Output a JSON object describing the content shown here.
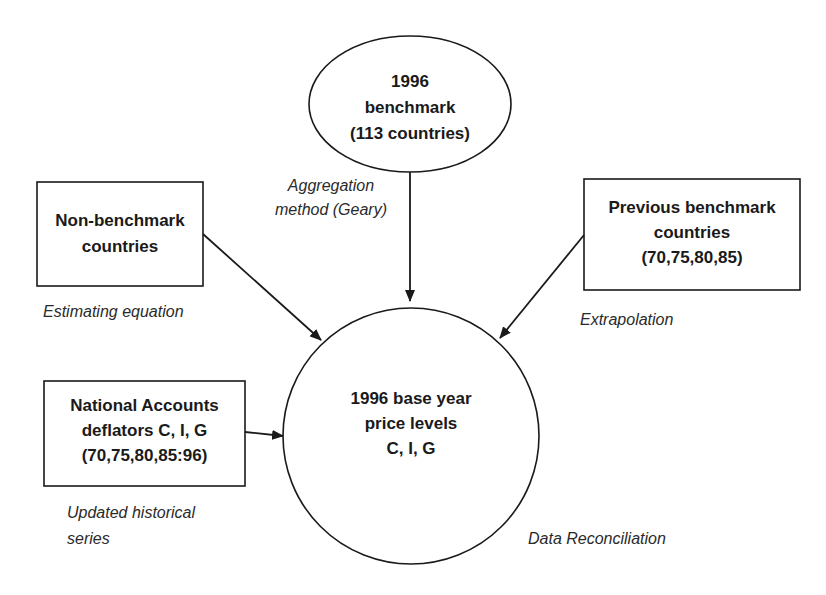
{
  "diagram": {
    "type": "flow",
    "nodes": {
      "benchmark_1996": {
        "shape": "ellipse",
        "lines": [
          "1996",
          "benchmark",
          "(113 countries)"
        ]
      },
      "non_benchmark": {
        "shape": "rectangle",
        "lines": [
          "Non-benchmark",
          "countries"
        ]
      },
      "previous_benchmark": {
        "shape": "rectangle",
        "lines": [
          "Previous benchmark",
          "countries",
          "(70,75,80,85)"
        ]
      },
      "national_accounts": {
        "shape": "rectangle",
        "lines": [
          "National Accounts",
          "deflators C, I, G",
          "(70,75,80,85:96)"
        ]
      },
      "base_year": {
        "shape": "circle",
        "lines": [
          "1996 base year",
          "price levels",
          "C, I, G"
        ]
      }
    },
    "edge_labels": {
      "aggregation": {
        "line1": "Aggregation",
        "line2_prefix": "method (",
        "line2_italic": "Geary",
        "line2_suffix": ")"
      },
      "estimating": "Estimating equation",
      "extrapolation": "Extrapolation",
      "updated": [
        "Updated historical",
        "series"
      ],
      "reconciliation": "Data Reconciliation"
    },
    "edges": [
      {
        "from": "benchmark_1996",
        "to": "base_year",
        "label": "Aggregation method (Geary)"
      },
      {
        "from": "non_benchmark",
        "to": "base_year",
        "label": "Estimating equation"
      },
      {
        "from": "previous_benchmark",
        "to": "base_year",
        "label": "Extrapolation"
      },
      {
        "from": "national_accounts",
        "to": "base_year",
        "label": "Updated historical series"
      }
    ],
    "colors": {
      "stroke": "#1a1a1a",
      "text": "#1a1a1a",
      "background": "#ffffff"
    }
  }
}
